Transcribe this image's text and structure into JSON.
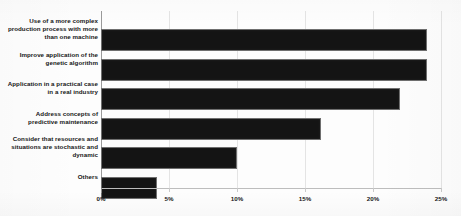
{
  "chart_data": {
    "type": "bar",
    "orientation": "horizontal",
    "title": "",
    "subtitle": "",
    "xlabel": "",
    "ylabel": "",
    "categories": [
      "Use of a more complex production process with more than one machine",
      "Improve application of the genetic algorithm",
      "Application in a practical case in a real industry",
      "Address concepts of predictive maintenance",
      "Consider that resources and situations are stochastic and dynamic",
      "Others"
    ],
    "values": [
      24.0,
      24.0,
      22.0,
      16.2,
      10.0,
      4.1
    ],
    "xlim": [
      0,
      25
    ],
    "xticks": [
      0,
      5,
      10,
      15,
      20,
      25
    ],
    "xtick_labels": [
      "0%",
      "5%",
      "10%",
      "15%",
      "20%",
      "25%"
    ],
    "grid": true,
    "legend": false,
    "legend_position": "none",
    "bar_color": "#141414",
    "gridline_color": "#e4e4e4",
    "axis_color": "#9a9a9a",
    "background_color": "#fdfdfd",
    "label_color": "#161616"
  }
}
